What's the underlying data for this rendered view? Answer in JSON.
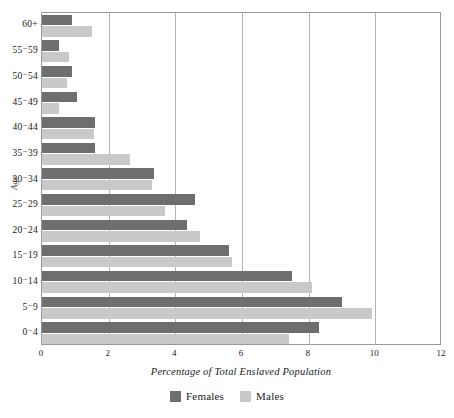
{
  "chart_data": {
    "type": "bar",
    "orientation": "horizontal",
    "title": "",
    "xlabel": "Percentage of Total Enslaved Population",
    "ylabel": "Age",
    "xlim": [
      0,
      12
    ],
    "xticks": [
      0,
      2,
      4,
      6,
      8,
      10,
      12
    ],
    "xtick_labels": [
      "0",
      "2",
      "4",
      "6",
      "8",
      "10",
      "12"
    ],
    "grid": "vertical",
    "legend_position": "bottom-center",
    "categories": [
      "0⁻4",
      "5⁻9",
      "10⁻14",
      "15⁻19",
      "20⁻24",
      "25⁻29",
      "30⁻34",
      "35⁻39",
      "40⁻44",
      "45⁻49",
      "50⁻54",
      "55⁻59",
      "60+"
    ],
    "category_order_top_to_bottom": [
      "60+",
      "55⁻59",
      "50⁻54",
      "45⁻49",
      "40⁻44",
      "35⁻39",
      "30⁻34",
      "25⁻29",
      "20⁻24",
      "15⁻19",
      "10⁻14",
      "5⁻9",
      "0⁻4"
    ],
    "series": [
      {
        "name": "Females",
        "color": "#6e6e6e",
        "values": [
          8.3,
          9.0,
          7.5,
          5.6,
          4.35,
          4.6,
          3.35,
          1.6,
          1.6,
          1.05,
          0.9,
          0.5,
          0.9
        ]
      },
      {
        "name": "Males",
        "color": "#c9c9c9",
        "values": [
          7.4,
          9.9,
          8.1,
          5.7,
          4.75,
          3.7,
          3.3,
          2.65,
          1.55,
          0.5,
          0.75,
          0.8,
          1.5
        ]
      }
    ]
  },
  "legend": {
    "items": [
      {
        "label": "Females",
        "color": "#6e6e6e"
      },
      {
        "label": "Males",
        "color": "#c9c9c9"
      }
    ]
  },
  "axes": {
    "x_title": "Percentage of Total Enslaved Population",
    "y_title": "Age"
  }
}
